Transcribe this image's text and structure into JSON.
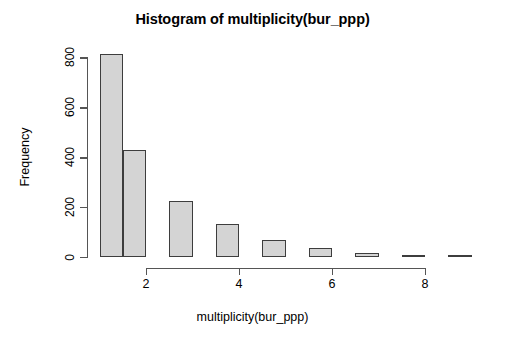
{
  "chart_data": {
    "type": "bar",
    "title": "Histogram of multiplicity(bur_ppp)",
    "xlabel": "multiplicity(bur_ppp)",
    "ylabel": "Frequency",
    "grid": false,
    "legend": null,
    "xlim": [
      1,
      9.5
    ],
    "ylim": [
      0,
      820
    ],
    "bin_width": 0.5,
    "bin_starts": [
      1.0,
      1.5,
      2.5,
      3.5,
      4.5,
      5.5,
      6.5,
      7.5,
      8.5
    ],
    "bin_ends": [
      1.5,
      2.0,
      3.0,
      4.0,
      5.0,
      6.0,
      7.0,
      8.0,
      9.0
    ],
    "categories": [
      "1.0-1.5",
      "1.5-2.0",
      "2.5-3.0",
      "3.5-4.0",
      "4.5-5.0",
      "5.5-6.0",
      "6.5-7.0",
      "7.5-8.0",
      "8.5-9.0"
    ],
    "values": [
      815,
      428,
      224,
      132,
      68,
      36,
      18,
      10,
      8
    ],
    "x_ticks": [
      2,
      4,
      6,
      8
    ],
    "x_tick_labels": [
      "2",
      "4",
      "6",
      "8"
    ],
    "y_ticks": [
      0,
      200,
      400,
      600,
      800
    ],
    "y_tick_labels": [
      "0",
      "200",
      "400",
      "600",
      "800"
    ],
    "bar_fill_color": "#d4d4d4",
    "bar_border_color": "#3d3d3d",
    "axis_color": "#555555",
    "background_color": "#ffffff"
  }
}
